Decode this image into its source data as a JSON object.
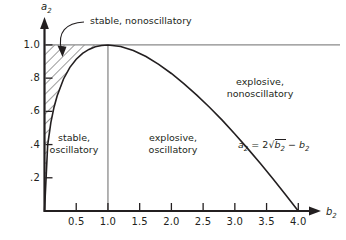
{
  "chart_data": {
    "type": "line",
    "title": "",
    "xlabel": "b_2",
    "ylabel": "a_2",
    "xlim": [
      0,
      4.35
    ],
    "ylim": [
      0,
      1.12
    ],
    "grid": false,
    "legend_position": "none",
    "xticks": [
      0.5,
      1.0,
      1.5,
      2.0,
      2.5,
      3.0,
      3.5,
      4.0
    ],
    "xticklabels": [
      "0.5",
      "1.0",
      "1.5",
      "2.0",
      "2.5",
      "3.0",
      "3.5",
      "4.0"
    ],
    "yticks": [
      0.2,
      0.4,
      0.6,
      0.8,
      1.0
    ],
    "yticklabels": [
      ".2",
      ".4",
      ".6",
      ".8",
      "1.0"
    ],
    "series": [
      {
        "name": "a2 = 2*sqrt(b2) - b2",
        "equation_text": "a₂ = 2√b₂ − b₂",
        "type": "curve",
        "x": [
          0.0,
          0.05,
          0.1,
          0.15,
          0.2,
          0.3,
          0.4,
          0.5,
          0.6,
          0.7,
          0.8,
          0.9,
          1.0,
          1.2,
          1.4,
          1.6,
          1.8,
          2.0,
          2.2,
          2.4,
          2.6,
          2.8,
          3.0,
          3.2,
          3.4,
          3.6,
          3.8,
          4.0
        ],
        "y": [
          0.0,
          0.397,
          0.532,
          0.625,
          0.694,
          0.795,
          0.865,
          0.914,
          0.949,
          0.973,
          0.989,
          0.997,
          1.0,
          0.991,
          0.966,
          0.93,
          0.883,
          0.828,
          0.766,
          0.698,
          0.625,
          0.547,
          0.464,
          0.377,
          0.287,
          0.194,
          0.098,
          0.0
        ]
      },
      {
        "name": "horizontal reference a2 = 1.0",
        "type": "hline",
        "value": 1.0,
        "color": "#808080"
      },
      {
        "name": "vertical reference b2 = 1.0",
        "type": "vline",
        "value": 1.0,
        "color": "#808080"
      }
    ],
    "shaded_region": {
      "name": "stable nonoscillatory hatched area",
      "pattern": "diagonal-hatch",
      "description": "Region bounded left by a2 axis, above by a2 = 1.0, right/below by the curve a2 = 2*sqrt(b2) - b2 for 0 <= b2 <= 1"
    },
    "annotations": [
      {
        "id": "stable-nonoscillatory",
        "text": "stable, nonoscillatory",
        "x": 0.72,
        "y": 1.12,
        "leader": true
      },
      {
        "id": "stable-oscillatory",
        "text": "stable,\noscillatory",
        "line1": "stable,",
        "line2": "oscillatory",
        "x": 0.38,
        "y": 0.44
      },
      {
        "id": "explosive-oscillatory",
        "text": "explosive,\noscillatory",
        "line1": "explosive,",
        "line2": "oscillatory",
        "x": 1.95,
        "y": 0.44
      },
      {
        "id": "explosive-nonoscillatory",
        "text": "explosive,\nnonoscillatory",
        "line1": "explosive,",
        "line2": "nonoscillatory",
        "x": 2.95,
        "y": 0.82
      },
      {
        "id": "curve-equation",
        "text": "a₂ = 2√b₂ − b₂",
        "x": 3.0,
        "y": 0.45
      }
    ],
    "colors": {
      "axis": "#231f20",
      "curve": "#231f20",
      "reference_line": "#808080",
      "text": "#231f20",
      "background": "#ffffff"
    }
  },
  "axes": {
    "x_name": "b",
    "x_sub": "2",
    "y_name": "a",
    "y_sub": "2"
  },
  "xticklabels": [
    "0.5",
    "1.0",
    "1.5",
    "2.0",
    "2.5",
    "3.0",
    "3.5",
    "4.0"
  ],
  "yticklabels": [
    ".2",
    ".4",
    ".6",
    ".8",
    "1.0"
  ],
  "labels": {
    "stable_nonoscillatory": "stable, nonoscillatory",
    "stable_l1": "stable,",
    "stable_l2": "oscillatory",
    "explosive_osc_l1": "explosive,",
    "explosive_osc_l2": "oscillatory",
    "explosive_nonosc_l1": "explosive,",
    "explosive_nonosc_l2": "nonoscillatory"
  },
  "equation": {
    "lhs": "a",
    "lhs_sub": "2",
    "eq": "=",
    "coef": "2",
    "radical": "√",
    "radicand": "b",
    "radicand_sub": "2",
    "minus": "−",
    "rhs": "b",
    "rhs_sub": "2"
  }
}
